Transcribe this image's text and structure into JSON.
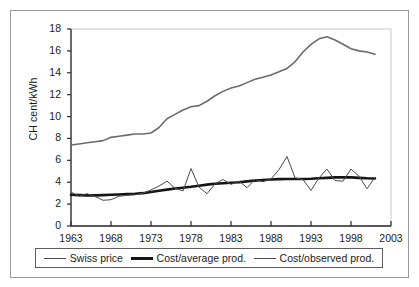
{
  "chart_data": {
    "type": "line",
    "title": "",
    "xlabel": "",
    "ylabel": "CH cent/kWh",
    "xlim": [
      1963,
      2003
    ],
    "ylim": [
      0,
      18
    ],
    "ytick_step": 2,
    "xtick_step": 5,
    "grid": false,
    "legend_position": "bottom",
    "yticks": [
      "18",
      "16",
      "14",
      "12",
      "10",
      "8",
      "6",
      "4",
      "2",
      "0"
    ],
    "xticks": [
      "1963",
      "1968",
      "1973",
      "1978",
      "1983",
      "1988",
      "1993",
      "1998",
      "2003"
    ],
    "x": [
      1963,
      1964,
      1965,
      1966,
      1967,
      1968,
      1969,
      1970,
      1971,
      1972,
      1973,
      1974,
      1975,
      1976,
      1977,
      1978,
      1979,
      1980,
      1981,
      1982,
      1983,
      1984,
      1985,
      1986,
      1987,
      1988,
      1989,
      1990,
      1991,
      1992,
      1993,
      1994,
      1995,
      1996,
      1997,
      1998,
      1999,
      2000,
      2001
    ],
    "series": [
      {
        "name": "Swiss price",
        "color": "#6b6b6b",
        "width": 1.6,
        "values": [
          7.4,
          7.5,
          7.6,
          7.7,
          7.8,
          8.1,
          8.2,
          8.3,
          8.4,
          8.4,
          8.5,
          9.0,
          9.8,
          10.2,
          10.6,
          10.9,
          11.0,
          11.4,
          11.9,
          12.3,
          12.6,
          12.8,
          13.1,
          13.4,
          13.6,
          13.8,
          14.1,
          14.4,
          15.0,
          15.9,
          16.6,
          17.1,
          17.3,
          17.0,
          16.6,
          16.2,
          16.0,
          15.9,
          15.7
        ]
      },
      {
        "name": "Cost/average prod.",
        "color": "#151515",
        "width": 2.6,
        "values": [
          2.85,
          2.82,
          2.8,
          2.8,
          2.82,
          2.85,
          2.88,
          2.92,
          2.95,
          3.0,
          3.1,
          3.22,
          3.32,
          3.42,
          3.5,
          3.58,
          3.68,
          3.78,
          3.86,
          3.9,
          3.95,
          4.0,
          4.08,
          4.15,
          4.2,
          4.25,
          4.28,
          4.3,
          4.3,
          4.3,
          4.32,
          4.36,
          4.4,
          4.44,
          4.46,
          4.44,
          4.4,
          4.36,
          4.34
        ]
      },
      {
        "name": "Cost/observed prod.",
        "color": "#4a4a4a",
        "width": 1.0,
        "values": [
          3.1,
          2.72,
          2.95,
          2.7,
          2.35,
          2.4,
          2.72,
          2.8,
          2.85,
          3.0,
          3.3,
          3.65,
          4.1,
          3.45,
          3.2,
          5.25,
          3.55,
          2.95,
          3.85,
          4.25,
          3.8,
          4.1,
          3.5,
          4.25,
          4.05,
          4.3,
          5.15,
          6.35,
          4.4,
          4.25,
          3.25,
          4.4,
          5.2,
          4.15,
          4.1,
          5.2,
          4.55,
          3.4,
          4.45
        ]
      }
    ]
  },
  "legend": {
    "items": [
      {
        "label": "Swiss price",
        "style": "thin"
      },
      {
        "label": "Cost/average prod.",
        "style": "thick"
      },
      {
        "label": "Cost/observed prod.",
        "style": "thin"
      }
    ]
  }
}
